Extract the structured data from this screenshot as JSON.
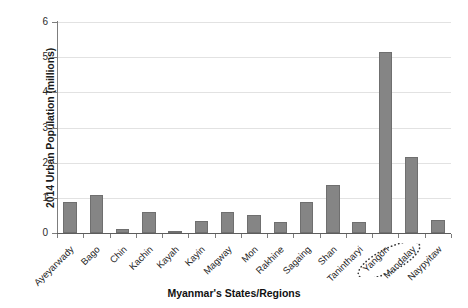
{
  "chart_data": {
    "type": "bar",
    "title": "",
    "xlabel": "Myanmar's States/Regions",
    "ylabel": "2014 Urban Population (millions)",
    "ylim": [
      0,
      6
    ],
    "yticks": [
      0,
      1,
      2,
      3,
      4,
      5,
      6
    ],
    "grid": "horizontal",
    "legend": "none",
    "bar_color": "#858585",
    "categories": [
      "Ayeyarwady",
      "Bago",
      "Chin",
      "Kachin",
      "Kayah",
      "Kayin",
      "Magway",
      "Mon",
      "Rakhine",
      "Sagaing",
      "Shan",
      "Tanintharyi",
      "Yangon",
      "Mandalay",
      "Naypyitaw"
    ],
    "values": [
      0.87,
      1.07,
      0.1,
      0.6,
      0.07,
      0.33,
      0.6,
      0.52,
      0.3,
      0.88,
      1.37,
      0.32,
      5.15,
      2.15,
      0.37
    ],
    "annotations": [
      {
        "type": "dotted-ellipse-highlight",
        "target_category": "Yangon",
        "note": "dotted ellipse drawn around the Yangon axis label"
      }
    ]
  },
  "axis": {
    "y_tick_labels": [
      "0",
      "1",
      "2",
      "3",
      "4",
      "5",
      "6"
    ]
  }
}
